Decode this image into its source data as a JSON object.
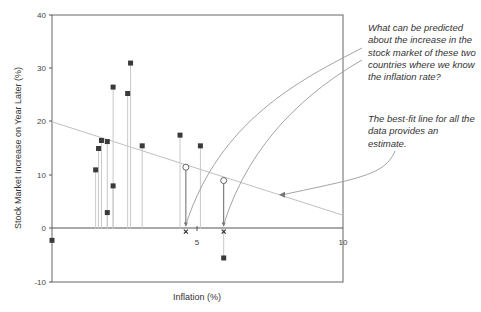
{
  "chart_data": {
    "type": "scatter",
    "title": "",
    "xlabel": "Inflation (%)",
    "ylabel": "Stock Market Increase on Year Later (%)",
    "xlim": [
      0,
      10
    ],
    "ylim": [
      -10,
      40
    ],
    "x_ticks": [
      "0",
      "5",
      "10"
    ],
    "y_ticks": [
      "40",
      "30",
      "20",
      "10",
      "0",
      "-10"
    ],
    "grid": false,
    "series": [
      {
        "name": "Countries (observed)",
        "marker": "square",
        "points": [
          {
            "x": 0.0,
            "y": -2.2
          },
          {
            "x": 1.5,
            "y": 11.0
          },
          {
            "x": 1.6,
            "y": 15.0
          },
          {
            "x": 1.7,
            "y": 16.5
          },
          {
            "x": 1.9,
            "y": 16.3
          },
          {
            "x": 1.9,
            "y": 3.0
          },
          {
            "x": 2.1,
            "y": 8.0
          },
          {
            "x": 2.1,
            "y": 26.5
          },
          {
            "x": 2.6,
            "y": 25.3
          },
          {
            "x": 2.7,
            "y": 31.0
          },
          {
            "x": 3.1,
            "y": 15.5
          },
          {
            "x": 4.4,
            "y": 17.5
          },
          {
            "x": 5.1,
            "y": 15.5
          },
          {
            "x": 5.9,
            "y": -5.5
          }
        ]
      },
      {
        "name": "Predicted (on best-fit line)",
        "marker": "open-circle",
        "points": [
          {
            "x": 4.6,
            "y": 11.5
          },
          {
            "x": 5.9,
            "y": 9.0
          }
        ]
      },
      {
        "name": "Known inflation rates",
        "marker": "x",
        "points": [
          {
            "x": 4.6,
            "y": 0
          },
          {
            "x": 5.9,
            "y": 0
          }
        ]
      }
    ],
    "best_fit_line": {
      "x0": 0,
      "y0": 20,
      "x1": 10,
      "y1": 2.5
    },
    "annotations": [
      "What can be predicted about the increase in the stock market of these two countries where we know the inflation rate?",
      "The best-fit line for all the data provides an estimate."
    ]
  },
  "axes": {
    "xlabel": "Inflation (%)",
    "ylabel": "Stock Market Increase on Year Later (%)",
    "x_tick_0": "0",
    "x_tick_5": "5",
    "x_tick_10": "10",
    "y_tick_40": "40",
    "y_tick_30": "30",
    "y_tick_20": "20",
    "y_tick_10": "10",
    "y_tick_0": "0",
    "y_tick_m10": "-10"
  },
  "notes": {
    "question": "What can be predicted about the increase in the stock market of these two countries where we know the inflation rate?",
    "estimate": "The best-fit line for all the data provides an estimate."
  },
  "colors": {
    "axis": "#555555",
    "marker": "#3a3a3a",
    "droplines": "#c8c8c8",
    "fitline": "#c0c0c0",
    "arrows": "#999999"
  }
}
